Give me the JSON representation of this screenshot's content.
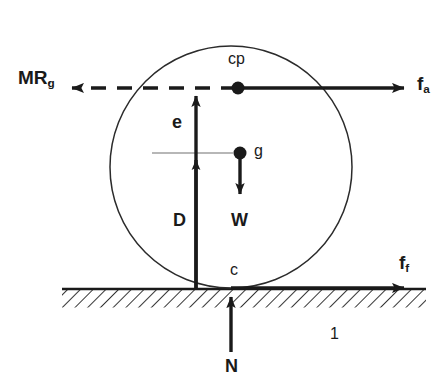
{
  "figure": {
    "ink_color": "#1a1a1a",
    "background_color": "#ffffff",
    "ground_label": "1"
  },
  "points": [
    {
      "id": "cp",
      "label": "cp",
      "x": 238,
      "y": 88,
      "description": "center of pressure"
    },
    {
      "id": "g",
      "label": "g",
      "x": 240,
      "y": 153,
      "description": "center of gravity"
    },
    {
      "id": "c",
      "label": "c",
      "x": 231,
      "y": 288,
      "description": "contact point"
    }
  ],
  "forces": [
    {
      "id": "f_a",
      "base": "f",
      "subscript": "a",
      "label": "f",
      "direction": "right",
      "style": "solid",
      "from_x": 238,
      "from_y": 88,
      "to_x": 412,
      "to_y": 88
    },
    {
      "id": "MRg",
      "base": "MR",
      "accent": "double-dot",
      "subscript": "g",
      "label": "MR",
      "direction": "left",
      "style": "dashed",
      "from_x": 196,
      "from_y": 88,
      "to_x": 62,
      "to_y": 88
    },
    {
      "id": "W",
      "label": "W",
      "direction": "down",
      "style": "solid",
      "from_x": 240,
      "from_y": 153,
      "to_x": 240,
      "to_y": 202
    },
    {
      "id": "N",
      "label": "N",
      "direction": "up",
      "style": "solid",
      "from_x": 231,
      "from_y": 352,
      "to_x": 231,
      "to_y": 290
    },
    {
      "id": "f_f",
      "base": "f",
      "subscript": "f",
      "label": "f",
      "direction": "right",
      "style": "solid",
      "from_x": 231,
      "from_y": 288,
      "to_x": 412,
      "to_y": 288
    }
  ],
  "dimensions": [
    {
      "id": "e",
      "label": "e",
      "orientation": "vertical",
      "from_y": 153,
      "to_y": 88,
      "x": 196,
      "description": "offset between cp level and g level"
    },
    {
      "id": "D",
      "label": "D",
      "orientation": "vertical",
      "from_y": 288,
      "to_y": 153,
      "x": 196,
      "description": "loaded radius from ground to g level"
    }
  ],
  "wheel": {
    "center_x": 231,
    "center_y": 167,
    "radius": 121,
    "stroke_width": 1.4
  },
  "ground": {
    "top_y": 288,
    "left_x": 62,
    "right_x": 426,
    "thickness": 18,
    "hatch_angle_deg": 45
  }
}
